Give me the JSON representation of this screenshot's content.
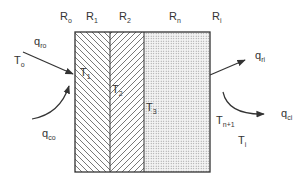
{
  "diagram": {
    "type": "multilayer-wall-heat-transfer",
    "colors": {
      "line": "#333333",
      "hatch": "#555555",
      "dots": "#888888",
      "background": "#ffffff"
    },
    "resistances": [
      {
        "id": "Ro",
        "main": "R",
        "sub": "o"
      },
      {
        "id": "R1",
        "main": "R",
        "sub": "1"
      },
      {
        "id": "R2",
        "main": "R",
        "sub": "2"
      },
      {
        "id": "Rn",
        "main": "R",
        "sub": "n"
      },
      {
        "id": "Ri",
        "main": "R",
        "sub": "i"
      }
    ],
    "temperatures": [
      {
        "id": "To",
        "main": "T",
        "sub": "o"
      },
      {
        "id": "T1",
        "main": "T",
        "sub": "1"
      },
      {
        "id": "T2",
        "main": "T",
        "sub": "2"
      },
      {
        "id": "T3",
        "main": "T",
        "sub": "3"
      },
      {
        "id": "Tn+1",
        "main": "T",
        "sub": "n+1"
      },
      {
        "id": "Ti",
        "main": "T",
        "sub": "i"
      }
    ],
    "heat_flows": [
      {
        "id": "qro",
        "main": "q",
        "sub": "ro",
        "desc": "radiation in, outer surface"
      },
      {
        "id": "qco",
        "main": "q",
        "sub": "co",
        "desc": "convection in, outer surface"
      },
      {
        "id": "qri",
        "main": "q",
        "sub": "ri",
        "desc": "radiation out, inner surface"
      },
      {
        "id": "qci",
        "main": "q",
        "sub": "ci",
        "desc": "convection out, inner surface"
      }
    ],
    "layers": [
      {
        "id": "layer-1",
        "pattern": "hatch-backslash"
      },
      {
        "id": "layer-2",
        "pattern": "hatch-slash"
      },
      {
        "id": "layer-n",
        "pattern": "dots"
      }
    ]
  }
}
